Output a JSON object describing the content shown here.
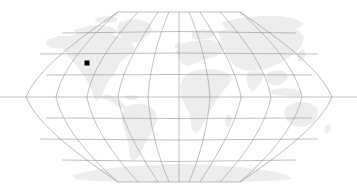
{
  "figure": {
    "kind": "world-map",
    "projection": "robinson",
    "background_color": "#ffffff",
    "land_color": "#ededed",
    "graticule_color": "#8c8c8c",
    "marker_color": "#000000",
    "title": "",
    "caption": ""
  },
  "map": {
    "frame": {
      "left_px": 25,
      "right_px": 333,
      "top_px": 12,
      "bottom_px": 182,
      "center_x_px": 179,
      "center_y_px": 97
    },
    "graticule": {
      "meridian_interval_deg": 30,
      "parallel_interval_deg": 30,
      "meridian_labels": [
        "-180",
        "-150",
        "-120",
        "-90",
        "-60",
        "-30",
        "0",
        "30",
        "60",
        "90",
        "120",
        "150",
        "180"
      ],
      "parallel_labels": [
        "90",
        "60",
        "30",
        "0",
        "-30",
        "-60",
        "-90"
      ],
      "show_grid": true
    },
    "landmasses": [
      "north-america",
      "greenland",
      "south-america",
      "africa",
      "europe",
      "asia",
      "australia",
      "antarctica"
    ],
    "markers": [
      {
        "name": "location-marker",
        "x_px": 87,
        "y_px": 63,
        "size_px": 5,
        "shape": "square",
        "color": "#000000",
        "label": ""
      }
    ]
  },
  "chart_data": {
    "type": "scatter",
    "title": "",
    "xlabel": "Longitude",
    "ylabel": "Latitude",
    "xlim": [
      -180,
      180
    ],
    "ylim": [
      -90,
      90
    ],
    "grid": true,
    "legend": "none",
    "series": [
      {
        "name": "location-marker",
        "x": [
          -122
        ],
        "y": [
          38
        ],
        "marker": "square",
        "color": "#000000",
        "size": 5
      }
    ],
    "xticks": [
      -180,
      -150,
      -120,
      -90,
      -60,
      -30,
      0,
      30,
      60,
      90,
      120,
      150,
      180
    ],
    "yticks": [
      -90,
      -60,
      -30,
      0,
      30,
      60,
      90
    ]
  }
}
